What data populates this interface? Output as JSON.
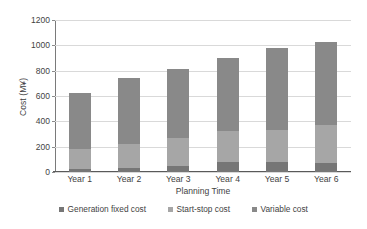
{
  "chart_data": {
    "type": "bar",
    "subtype": "stacked-bar",
    "title": "",
    "xlabel": "Planning Time",
    "ylabel": "Cost (M¥)",
    "categories": [
      "Year 1",
      "Year 2",
      "Year 3",
      "Year 4",
      "Year 5",
      "Year 6"
    ],
    "series": [
      {
        "name": "Generation fixed cost",
        "color": "#767676",
        "values": [
          25,
          30,
          45,
          80,
          80,
          70
        ]
      },
      {
        "name": "Start-stop cost",
        "color": "#a6a6a6",
        "values": [
          155,
          195,
          225,
          240,
          250,
          300
        ]
      },
      {
        "name": "Variable cost",
        "color": "#898989",
        "values": [
          445,
          520,
          540,
          580,
          650,
          660
        ]
      }
    ],
    "totals": [
      625,
      745,
      810,
      900,
      980,
      1030
    ],
    "ylim": [
      0,
      1200
    ],
    "ytick_step": 200,
    "yticks": [
      "1200",
      "1000",
      "800",
      "600",
      "400",
      "200",
      "0"
    ],
    "grid": true,
    "legend_position": "bottom"
  },
  "legend": {
    "items": [
      {
        "label": "Generation fixed cost",
        "color": "#767676"
      },
      {
        "label": "Start-stop cost",
        "color": "#a6a6a6"
      },
      {
        "label": "Variable cost",
        "color": "#898989"
      }
    ]
  },
  "colors": {
    "gridline": "#d9d9d9",
    "axis": "#5a5a5a",
    "text": "#3f3f3f",
    "background": "#ffffff"
  }
}
